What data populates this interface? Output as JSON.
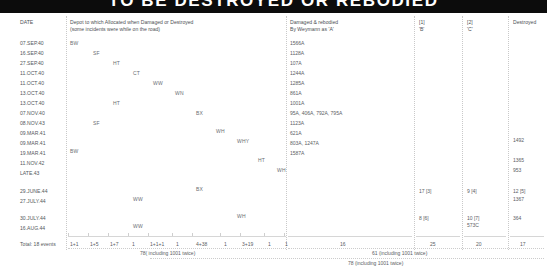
{
  "banner": {
    "title": "TO BE DESTROYED OR REBODIED"
  },
  "columns": {
    "date": "DATE",
    "depot_line1": "Depot to which Allocated when Damaged or Destroyed",
    "depot_line2": "(some incidents were while on the road)",
    "rebodied_line1": "Damaged & rebodied",
    "rebodied_line2": "By Weymann as 'A'",
    "col1_ref": "[1]",
    "col1_label": "'B'",
    "col2_ref": "[2]",
    "col2_label": "'C'",
    "destroyed": "Destroyed"
  },
  "rows": [
    {
      "date": "07.SEP.40",
      "depot": "BW",
      "depot_col": 0,
      "rebodied": "1566A",
      "b": "",
      "c": "",
      "destroyed": ""
    },
    {
      "date": "16.SEP.40",
      "depot": "SF",
      "depot_col": 1,
      "rebodied": "1128A",
      "b": "",
      "c": "",
      "destroyed": ""
    },
    {
      "date": "27.SEP.40",
      "depot": "HT",
      "depot_col": 2,
      "rebodied": "107A",
      "b": "",
      "c": "",
      "destroyed": ""
    },
    {
      "date": "11.OCT.40",
      "depot": "CT",
      "depot_col": 3,
      "rebodied": "1244A",
      "b": "",
      "c": "",
      "destroyed": ""
    },
    {
      "date": "11.OCT.40",
      "depot": "WW",
      "depot_col": 4,
      "rebodied": "1285A",
      "b": "",
      "c": "",
      "destroyed": ""
    },
    {
      "date": "13.OCT.40",
      "depot": "WN",
      "depot_col": 5,
      "rebodied": "861A",
      "b": "",
      "c": "",
      "destroyed": ""
    },
    {
      "date": "13.OCT.40",
      "depot": "HT",
      "depot_col": 2,
      "rebodied": "1001A",
      "b": "",
      "c": "",
      "destroyed": ""
    },
    {
      "date": "07.NOV.40",
      "depot": "BX",
      "depot_col": 6,
      "rebodied": "95A, 406A, 792A, 795A",
      "b": "",
      "c": "",
      "destroyed": ""
    },
    {
      "date": "08.NOV.43",
      "depot": "SF",
      "depot_col": 1,
      "rebodied": "1123A",
      "b": "",
      "c": "",
      "destroyed": ""
    },
    {
      "date": "09.MAR.41",
      "depot": "WH",
      "depot_col": 7,
      "rebodied": "621A",
      "b": "",
      "c": "",
      "destroyed": ""
    },
    {
      "date": "09.MAR.41",
      "depot": "WHY",
      "depot_col": 8,
      "rebodied": "803A, 1247A",
      "b": "",
      "c": "",
      "destroyed": "1492"
    },
    {
      "date": "19.MAR.41",
      "depot": "BW",
      "depot_col": 0,
      "rebodied": "1587A",
      "b": "",
      "c": "",
      "destroyed": ""
    },
    {
      "date": "11.NOV.42",
      "depot": "HT",
      "depot_col": 9,
      "rebodied": "",
      "b": "",
      "c": "",
      "destroyed": "1365"
    },
    {
      "date": "LATE.43",
      "depot": "WH",
      "depot_col": 10,
      "rebodied": "",
      "b": "",
      "c": "",
      "destroyed": "953"
    },
    {
      "date": "29.JUNE.44",
      "depot": "BX",
      "depot_col": 6,
      "rebodied": "",
      "b": "17 [3]",
      "c": "9 [4]",
      "destroyed": "12 [5]"
    },
    {
      "date": "27.JULY.44",
      "depot": "WW",
      "depot_col": 4,
      "rebodied": "",
      "b": "",
      "c": "",
      "destroyed": "1367"
    },
    {
      "date": "30.JULY.44",
      "depot": "WH",
      "depot_col": 8,
      "rebodied": "",
      "b": "8 [6]",
      "c": "10 [7]",
      "destroyed": "364"
    },
    {
      "date": "16.AUG.44",
      "depot": "WW",
      "depot_col": 4,
      "rebodied": "",
      "b": "",
      "c": "573C",
      "destroyed": ""
    }
  ],
  "totals": {
    "date_label": "Total: 18 events",
    "depot_counts": [
      "1+1",
      "1+5",
      "1+7",
      "1",
      "1+1+1",
      "1",
      "4+38",
      "1",
      "3+19",
      "1",
      "1"
    ],
    "depot_sum": "78( including 1001 twice)",
    "rebodied": "16",
    "b": "25",
    "c": "20",
    "destroyed": "17",
    "subtotal_note": "61 (including 1001 twice)",
    "grand_note": "78 (including 1001 twice)"
  }
}
